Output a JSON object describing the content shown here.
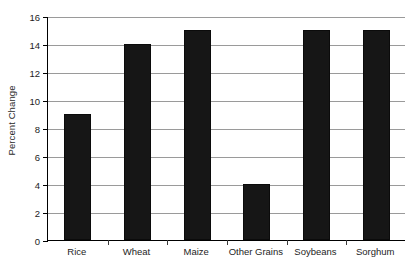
{
  "chart_data": {
    "type": "bar",
    "title": "",
    "subtitle": "",
    "xlabel": "",
    "ylabel": "Percent Change",
    "categories": [
      "Rice",
      "Wheat",
      "Maize",
      "Other Grains",
      "Soybeans",
      "Sorghum"
    ],
    "values": [
      9,
      14,
      15,
      4,
      15,
      15
    ],
    "ylim": [
      0,
      16
    ],
    "ytick_step": 2,
    "ytick_labels": [
      "0",
      "2",
      "4",
      "6",
      "8",
      "10",
      "12",
      "14",
      "16"
    ],
    "ytick_values": [
      0,
      2,
      4,
      6,
      8,
      10,
      12,
      14,
      16
    ],
    "grid": "horizontal",
    "legend": "none",
    "annotations": [],
    "colors": {
      "bar": "#161616",
      "gridline": "#9a9a9a",
      "axis": "#000000",
      "background": "#ffffff",
      "text": "#1c1c1c"
    }
  }
}
